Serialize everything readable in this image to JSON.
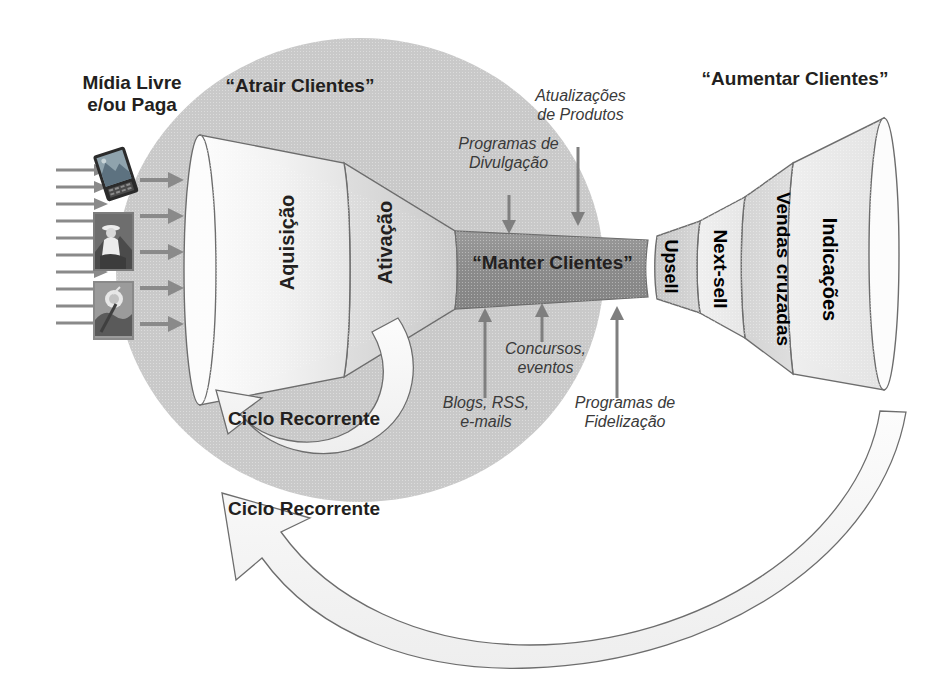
{
  "diagram": {
    "title_left": "Mídia Livre\ne/ou Paga",
    "zone_left_label": "“Atrair Clientes”",
    "zone_right_label": "“Aumentar Clientes”",
    "core_label": "“Manter Clientes”"
  },
  "left_funnel": {
    "stages": [
      {
        "name": "aquisicao",
        "label": "Aquisição"
      },
      {
        "name": "ativacao",
        "label": "Ativação"
      }
    ]
  },
  "right_funnel": {
    "stages": [
      {
        "name": "upsell",
        "label": "Upsell"
      },
      {
        "name": "next-sell",
        "label": "Next-sell"
      },
      {
        "name": "vendas-cruzadas",
        "label": "Vendas cruzadas"
      },
      {
        "name": "indicacoes",
        "label": "Indicações"
      }
    ]
  },
  "annotations": {
    "top": [
      {
        "name": "programas-de-divulgacao",
        "label": "Programas de\nDivulgação"
      },
      {
        "name": "atualizacoes-de-produtos",
        "label": "Atualizações\nde Produtos"
      }
    ],
    "bottom": [
      {
        "name": "blogs-rss-emails",
        "label": "Blogs, RSS,\ne-mails"
      },
      {
        "name": "concursos-eventos",
        "label": "Concursos,\neventos"
      },
      {
        "name": "programas-de-fidelizacao",
        "label": "Programas de\nFidelização"
      }
    ]
  },
  "cycles": [
    {
      "name": "ciclo-recorrente-interno",
      "label": "Ciclo Recorrente"
    },
    {
      "name": "ciclo-recorrente-externo",
      "label": "Ciclo Recorrente"
    }
  ],
  "media_icons": [
    {
      "name": "handheld-device-photo"
    },
    {
      "name": "cowboy-on-horse-photo"
    },
    {
      "name": "golf-swing-photo"
    }
  ],
  "colors": {
    "circle_zone": "#c9c9c9",
    "funnel_light": "#e6e6e6",
    "funnel_mid": "#d2d2d2",
    "funnel_dark": "#909090",
    "funnel_white": "#fbfbfb",
    "stroke": "#6d6d6d",
    "text": "#231f20",
    "arrow_gray": "#8a8a8a"
  },
  "counts": {
    "inflow_arrows_outer": 10,
    "inflow_arrows_inner": 5
  }
}
